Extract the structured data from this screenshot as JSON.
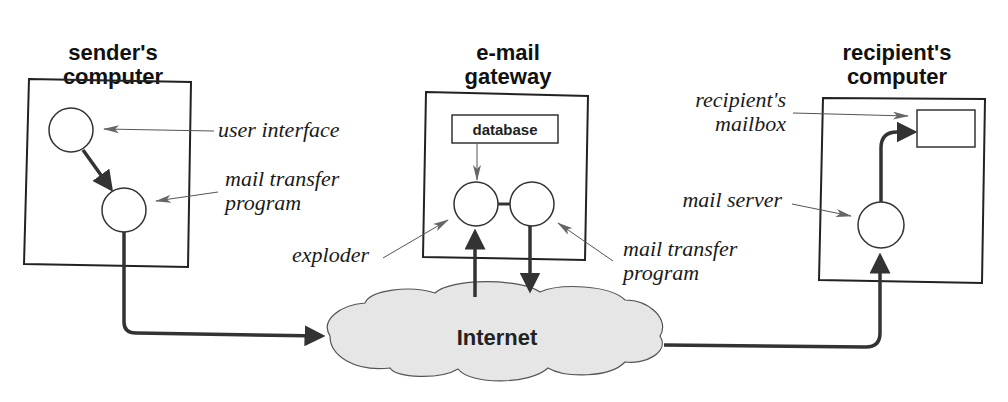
{
  "diagram": {
    "type": "e-mail exploder / mailing list gateway",
    "nodes": {
      "sender": {
        "title_line1": "sender's",
        "title_line2": "computer"
      },
      "gateway": {
        "title_line1": "e-mail",
        "title_line2": "gateway",
        "database_label": "database"
      },
      "recipient": {
        "title_line1": "recipient's",
        "title_line2": "computer"
      },
      "internet": {
        "label": "Internet"
      }
    },
    "annotations": {
      "user_interface": "user interface",
      "sender_mtp_line1": "mail transfer",
      "sender_mtp_line2": "program",
      "exploder": "exploder",
      "gateway_mtp_line1": "mail transfer",
      "gateway_mtp_line2": "program",
      "mailbox_line1": "recipient's",
      "mailbox_line2": "mailbox",
      "mail_server": "mail server"
    },
    "colors": {
      "cloud_fill": "#e6e6e6",
      "stroke": "#333333"
    }
  }
}
